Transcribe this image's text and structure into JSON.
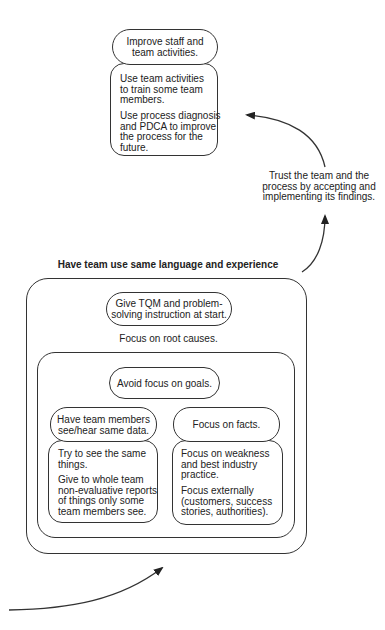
{
  "improve_group": {
    "header": [
      "Improve staff and",
      "team activities."
    ],
    "paragraphs": [
      [
        "Use team activities",
        "to train some team",
        "members."
      ],
      [
        "Use process diagnosis",
        "and PDCA to improve",
        "the process for the",
        "future."
      ]
    ]
  },
  "trust_note": [
    "Trust the team and the",
    "process by accepting and",
    "implementing its findings."
  ],
  "language_group": {
    "title": "Have team use same language and experience",
    "tqm_pill": [
      "Give TQM and problem-",
      "solving instruction at start."
    ],
    "root_causes": "Focus on root causes.",
    "inner": {
      "avoid_pill": "Avoid focus on goals.",
      "same_data": {
        "header": [
          "Have team members",
          "see/hear same data."
        ],
        "paragraphs": [
          [
            "Try to see the same",
            "things."
          ],
          [
            "Give to whole team",
            "non-evaluative reports",
            "of things only some",
            "team members see."
          ]
        ]
      },
      "facts": {
        "header": "Focus on facts.",
        "paragraphs": [
          [
            "Focus on weakness",
            "and best industry",
            "practice."
          ],
          [
            "Focus externally",
            "(customers, success",
            "stories, authorities)."
          ]
        ]
      }
    }
  },
  "colors": {
    "stroke": "#333333",
    "text": "#222222",
    "background": "#ffffff"
  },
  "arrows": [
    "arrow-into-language-group",
    "arrow-language-to-trust",
    "arrow-trust-to-improve"
  ]
}
